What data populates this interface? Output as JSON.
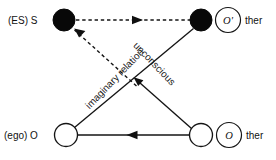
{
  "diagram": {
    "background_color": "#ffffff",
    "stroke_color": "#141414",
    "fill_color": "#080808",
    "nodes": [
      {
        "id": "subject",
        "label": "(ES) S",
        "style": "filled",
        "x": 64,
        "y": 20,
        "r": 11,
        "label_x": 8,
        "label_y": 24
      },
      {
        "id": "other-small",
        "label": "",
        "style": "filled",
        "x": 201,
        "y": 20,
        "r": 11,
        "label_x": 0,
        "label_y": 0
      },
      {
        "id": "ego",
        "label": "(ego) O",
        "style": "open",
        "x": 66,
        "y": 135,
        "r": 11.5,
        "label_x": 4,
        "label_y": 139
      },
      {
        "id": "other-big",
        "label": "",
        "style": "open",
        "x": 201,
        "y": 135,
        "r": 11.5,
        "label_x": 0,
        "label_y": 0
      }
    ],
    "rings": [
      {
        "id": "other-prime-ring",
        "glyph": "O'",
        "suffix": "ther",
        "x": 228,
        "y": 20,
        "r_outer": 12.5,
        "suffix_x": 245,
        "suffix_y": 24
      },
      {
        "id": "other-capital-ring",
        "glyph": "O",
        "suffix": "ther",
        "x": 229,
        "y": 135,
        "r_outer": 12.5,
        "suffix_x": 246,
        "suffix_y": 139
      }
    ],
    "edges": [
      {
        "id": "imaginary-axis-top",
        "from": "subject",
        "to": "other-small",
        "style": "dashed",
        "arrow_direction": "right",
        "label": ""
      },
      {
        "id": "imaginary-relation-diagonal",
        "from": "other-big",
        "to": "subject",
        "style": "dashed",
        "arrow_direction": "up-left",
        "label": "imaginary relation",
        "label_x": 117,
        "label_y": 81,
        "label_rotation": -46
      },
      {
        "id": "unconscious-diagonal",
        "from": "other-small",
        "to": "ego",
        "style": "solid",
        "arrow_direction": "down-left",
        "label": "unconscious",
        "label_x": 150,
        "label_y": 67,
        "label_rotation": 46
      },
      {
        "id": "ego-to-other-bottom",
        "from": "other-big",
        "to": "ego",
        "style": "solid",
        "arrow_direction": "left",
        "label": ""
      },
      {
        "id": "ego-to-upper-right",
        "from": "ego",
        "to": "other-small",
        "style": "solid",
        "arrow_direction": "none",
        "label": ""
      }
    ],
    "labels": {
      "subject_label": "(ES) S",
      "ego_label": "(ego) O",
      "other_prime_glyph": "O'",
      "other_glyph": "O",
      "other_prime_suffix": "ther",
      "other_suffix": "ther",
      "imaginary_relation": "imaginary relation",
      "unconscious": "unconscious"
    }
  }
}
